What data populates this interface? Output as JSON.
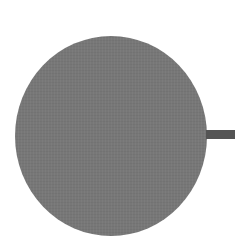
{
  "diagram": {
    "nodes": [
      {
        "id": "circle-node",
        "shape": "circle",
        "fill": "#777777",
        "label": ""
      }
    ],
    "edges": [
      {
        "from": "circle-node",
        "direction": "right",
        "color": "#545454"
      }
    ],
    "background": "#ffffff"
  }
}
